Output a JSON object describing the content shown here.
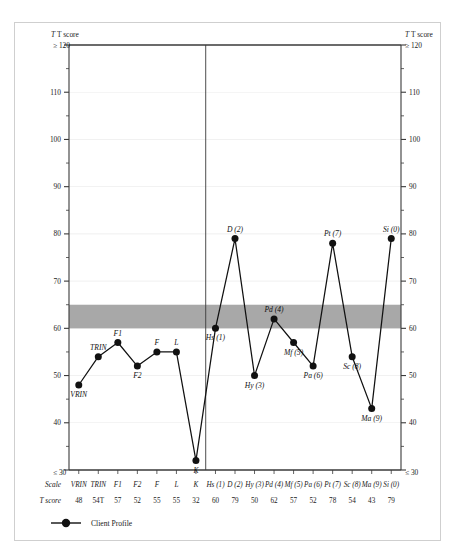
{
  "chart_data": {
    "type": "line",
    "title": "",
    "xlabel": "Scale",
    "ylabel": "T score",
    "ylim": [
      30,
      120
    ],
    "grid": false,
    "legend_position": "bottom-left",
    "y_axis_label_left": "T score",
    "y_axis_label_right": "T score",
    "y_top_label": "≥ 120",
    "y_bottom_label": "≤ 30",
    "y_ticks": [
      110,
      100,
      90,
      80,
      70,
      60,
      50,
      40
    ],
    "minor_tick_step": 5,
    "shaded_band": {
      "from": 60,
      "to": 65,
      "color": "#a8a8a8",
      "label": ""
    },
    "section_divider_after": "K",
    "categories": [
      "VRIN",
      "TRIN",
      "F1",
      "F2",
      "F",
      "L",
      "K",
      "Hs (1)",
      "D  (2)",
      "Hy (3)",
      "Pd (4)",
      "Mf (5)",
      "Pa (6)",
      "Pt (7)",
      "Sc (8)",
      "Ma (9)",
      "Si (0)"
    ],
    "values": [
      48,
      54,
      57,
      52,
      55,
      55,
      32,
      60,
      79,
      50,
      62,
      57,
      52,
      78,
      54,
      43,
      79
    ],
    "displayed_scores": [
      "48",
      "54T",
      "57",
      "52",
      "55",
      "55",
      "32",
      "60",
      "79",
      "50",
      "62",
      "57",
      "52",
      "78",
      "54",
      "43",
      "79"
    ],
    "point_label_position": [
      "below",
      "above",
      "above",
      "below",
      "above",
      "above",
      "below",
      "below",
      "above",
      "below",
      "above",
      "below",
      "below",
      "above",
      "below",
      "below",
      "above"
    ],
    "series": [
      {
        "name": "Client Profile",
        "values": [
          48,
          54,
          57,
          52,
          55,
          55,
          32,
          60,
          79,
          50,
          62,
          57,
          52,
          78,
          54,
          43,
          79
        ],
        "color": "#111111",
        "marker": "filled-circle"
      }
    ],
    "table": {
      "row_headers": [
        "Scale",
        "T score"
      ],
      "scales": [
        "VRIN",
        "TRIN",
        "F1",
        "F2",
        "F",
        "L",
        "K",
        "Hs (1)",
        "D  (2)",
        "Hy (3)",
        "Pd (4)",
        "Mf (5)",
        "Pa (6)",
        "Pt (7)",
        "Sc (8)",
        "Ma (9)",
        "Si (0)"
      ],
      "scores": [
        "48",
        "54T",
        "57",
        "52",
        "55",
        "55",
        "32",
        "60",
        "79",
        "50",
        "62",
        "57",
        "52",
        "78",
        "54",
        "43",
        "79"
      ]
    },
    "legend": [
      {
        "label": "Client Profile",
        "color": "#111111",
        "marker": "filled-circle"
      }
    ]
  },
  "colors": {
    "line": "#111111",
    "marker": "#111111",
    "band": "#a8a8a8",
    "axis": "#3a3a3a",
    "frame": "#cfcfcf",
    "gridline": "#bdbdbd"
  }
}
